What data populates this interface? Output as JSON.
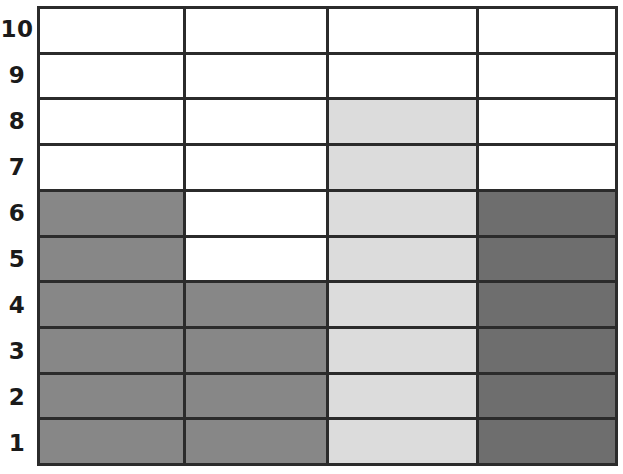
{
  "chart_data": {
    "type": "bar",
    "title": "",
    "subtitle": "",
    "xlabel": "",
    "ylabel": "",
    "orientation": "vertical",
    "grid": true,
    "legend": "none",
    "categories": [
      "1",
      "2",
      "3",
      "4"
    ],
    "y_tick_labels": [
      "10",
      "9",
      "8",
      "7",
      "6",
      "5",
      "4",
      "3",
      "2",
      "1"
    ],
    "y_tick_labels_top_to_bottom": [
      "10",
      "9",
      "8",
      "7",
      "6",
      "5",
      "4",
      "3",
      "2",
      "1"
    ],
    "ylim": [
      0,
      10
    ],
    "values": [
      6,
      4,
      8,
      6
    ],
    "series": [
      {
        "name": "bar-1",
        "category": "1",
        "value": 6,
        "color": "#878787",
        "filled_rows": [
          1,
          2,
          3,
          4,
          5,
          6
        ]
      },
      {
        "name": "bar-2",
        "category": "2",
        "value": 4,
        "color": "#878787",
        "filled_rows": [
          1,
          2,
          3,
          4
        ]
      },
      {
        "name": "bar-3",
        "category": "3",
        "value": 8,
        "color": "#dcdcdc",
        "filled_rows": [
          1,
          2,
          3,
          4,
          5,
          6,
          7,
          8
        ]
      },
      {
        "name": "bar-4",
        "category": "4",
        "value": 6,
        "color": "#6e6e6e",
        "filled_rows": [
          1,
          2,
          3,
          4,
          5,
          6
        ]
      }
    ],
    "empty_cell_color": "#ffffff",
    "gridline_color": "#2b2b2b",
    "label_color": "#1a1a1a"
  },
  "rows": [
    {
      "label": "10",
      "cells": [
        "#ffffff",
        "#ffffff",
        "#ffffff",
        "#ffffff"
      ]
    },
    {
      "label": "9",
      "cells": [
        "#ffffff",
        "#ffffff",
        "#ffffff",
        "#ffffff"
      ]
    },
    {
      "label": "8",
      "cells": [
        "#ffffff",
        "#ffffff",
        "#dcdcdc",
        "#ffffff"
      ]
    },
    {
      "label": "7",
      "cells": [
        "#ffffff",
        "#ffffff",
        "#dcdcdc",
        "#ffffff"
      ]
    },
    {
      "label": "6",
      "cells": [
        "#878787",
        "#ffffff",
        "#dcdcdc",
        "#6e6e6e"
      ]
    },
    {
      "label": "5",
      "cells": [
        "#878787",
        "#ffffff",
        "#dcdcdc",
        "#6e6e6e"
      ]
    },
    {
      "label": "4",
      "cells": [
        "#878787",
        "#878787",
        "#dcdcdc",
        "#6e6e6e"
      ]
    },
    {
      "label": "3",
      "cells": [
        "#878787",
        "#878787",
        "#dcdcdc",
        "#6e6e6e"
      ]
    },
    {
      "label": "2",
      "cells": [
        "#878787",
        "#878787",
        "#dcdcdc",
        "#6e6e6e"
      ]
    },
    {
      "label": "1",
      "cells": [
        "#878787",
        "#878787",
        "#dcdcdc",
        "#6e6e6e"
      ]
    }
  ]
}
